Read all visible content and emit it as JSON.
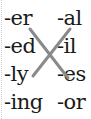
{
  "left_column": [
    "-er",
    "-ed",
    "-ly",
    "-ing"
  ],
  "right_column": [
    "-al",
    "-il",
    "-es",
    "-or"
  ],
  "connections": [
    {
      "from": "-er",
      "to": "-es"
    },
    {
      "from": "-ly",
      "to": "-al"
    }
  ],
  "line_color": "#8a8a8a"
}
